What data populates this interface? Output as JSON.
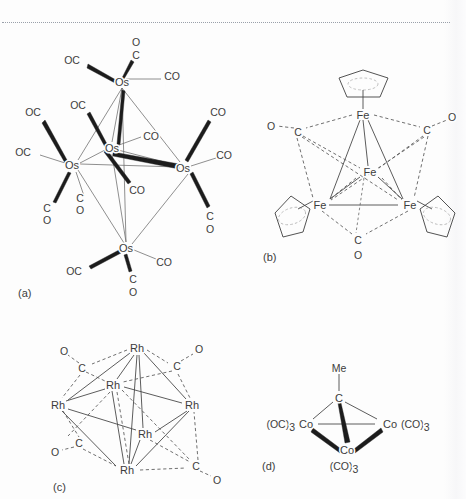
{
  "page": {
    "background_color": "#fdfdfd",
    "ink_color": "#3c3c3c",
    "bond_color": "#4a4a4a",
    "wedge_color": "#1c1c1c",
    "rule": {
      "style": "dotted",
      "color": "#9aa0aa"
    }
  },
  "figure": {
    "type": "chemical-structure-diagram",
    "panels": [
      {
        "key": "a",
        "label": "(a)",
        "compound": "Os6(CO)18 trigonal-bipyramidal osmium carbonyl cluster",
        "metal": "Os",
        "metal_count": 5,
        "geometry": "trigonal bipyramid",
        "atoms": [
          {
            "id": "os-apex-top",
            "label": "Os",
            "x": 122,
            "y": 82
          },
          {
            "id": "os-equat-left",
            "label": "Os",
            "x": 72,
            "y": 165
          },
          {
            "id": "os-equat-mid",
            "label": "Os",
            "x": 112,
            "y": 148
          },
          {
            "id": "os-equat-right",
            "label": "Os",
            "x": 183,
            "y": 168
          },
          {
            "id": "os-apex-bottom",
            "label": "Os",
            "x": 126,
            "y": 248
          }
        ],
        "ligands": [
          {
            "id": "a-lig-1",
            "label": "O",
            "x": 136,
            "y": 42
          },
          {
            "id": "a-lig-2",
            "label": "C",
            "x": 136,
            "y": 55
          },
          {
            "id": "a-lig-3",
            "label": "OC",
            "x": 72,
            "y": 60
          },
          {
            "id": "a-lig-4",
            "label": "CO",
            "x": 166,
            "y": 76
          },
          {
            "id": "a-lig-5",
            "label": "OC",
            "x": 78,
            "y": 105
          },
          {
            "id": "a-lig-6",
            "label": "CO",
            "x": 145,
            "y": 136
          },
          {
            "id": "a-lig-7",
            "label": "OC",
            "x": 33,
            "y": 112
          },
          {
            "id": "a-lig-8",
            "label": "OC",
            "x": 23,
            "y": 152
          },
          {
            "id": "a-lig-9",
            "label": "C",
            "x": 47,
            "y": 208
          },
          {
            "id": "a-lig-10",
            "label": "O",
            "x": 47,
            "y": 220
          },
          {
            "id": "a-lig-11",
            "label": "C",
            "x": 80,
            "y": 198
          },
          {
            "id": "a-lig-12",
            "label": "O",
            "x": 80,
            "y": 210
          },
          {
            "id": "a-lig-13",
            "label": "CO",
            "x": 131,
            "y": 190
          },
          {
            "id": "a-lig-14",
            "label": "CO",
            "x": 216,
            "y": 112
          },
          {
            "id": "a-lig-15",
            "label": "CO",
            "x": 222,
            "y": 155
          },
          {
            "id": "a-lig-16",
            "label": "C",
            "x": 210,
            "y": 216
          },
          {
            "id": "a-lig-17",
            "label": "O",
            "x": 210,
            "y": 229
          },
          {
            "id": "a-lig-18",
            "label": "OC",
            "x": 74,
            "y": 271
          },
          {
            "id": "a-lig-19",
            "label": "CO",
            "x": 161,
            "y": 262
          },
          {
            "id": "a-lig-20",
            "label": "C",
            "x": 133,
            "y": 279
          },
          {
            "id": "a-lig-21",
            "label": "O",
            "x": 133,
            "y": 292
          }
        ]
      },
      {
        "key": "b",
        "label": "(b)",
        "compound": "Cp4Fe4(CO)4 tetrahedral iron cluster with cyclopentadienyl ligands and triply-bridging carbonyls",
        "metal": "Fe",
        "metal_count": 4,
        "geometry": "tetrahedron",
        "atoms": [
          {
            "id": "fe-top",
            "label": "Fe",
            "x": 363,
            "y": 115
          },
          {
            "id": "fe-center",
            "label": "Fe",
            "x": 370,
            "y": 172
          },
          {
            "id": "fe-left",
            "label": "Fe",
            "x": 320,
            "y": 205
          },
          {
            "id": "fe-right",
            "label": "Fe",
            "x": 410,
            "y": 205
          }
        ],
        "ligands": [
          {
            "id": "b-lig-1",
            "label": "O",
            "x": 271,
            "y": 126
          },
          {
            "id": "b-lig-2",
            "label": "C",
            "x": 298,
            "y": 132
          },
          {
            "id": "b-lig-3",
            "label": "O",
            "x": 452,
            "y": 117
          },
          {
            "id": "b-lig-4",
            "label": "C",
            "x": 427,
            "y": 130
          },
          {
            "id": "b-lig-5",
            "label": "C",
            "x": 358,
            "y": 240
          },
          {
            "id": "b-lig-6",
            "label": "O",
            "x": 358,
            "y": 255
          }
        ],
        "cyclopentadienyl_rings": 4
      },
      {
        "key": "c",
        "label": "(c)",
        "compound": "Rh6(CO)16 octahedral rhodium carbonyl cluster with face-bridging carbonyls",
        "metal": "Rh",
        "metal_count": 6,
        "geometry": "octahedron",
        "atoms": [
          {
            "id": "rh-top",
            "label": "Rh",
            "x": 137,
            "y": 348
          },
          {
            "id": "rh-inner",
            "label": "Rh",
            "x": 113,
            "y": 385
          },
          {
            "id": "rh-left",
            "label": "Rh",
            "x": 58,
            "y": 405
          },
          {
            "id": "rh-right",
            "label": "Rh",
            "x": 192,
            "y": 405
          },
          {
            "id": "rh-mid",
            "label": "Rh",
            "x": 145,
            "y": 434
          },
          {
            "id": "rh-bottom",
            "label": "Rh",
            "x": 127,
            "y": 470
          }
        ],
        "ligands": [
          {
            "id": "c-lig-1",
            "label": "O",
            "x": 64,
            "y": 351
          },
          {
            "id": "c-lig-2",
            "label": "C",
            "x": 82,
            "y": 368
          },
          {
            "id": "c-lig-3",
            "label": "O",
            "x": 199,
            "y": 349
          },
          {
            "id": "c-lig-4",
            "label": "C",
            "x": 177,
            "y": 366
          },
          {
            "id": "c-lig-5",
            "label": "C",
            "x": 79,
            "y": 443
          },
          {
            "id": "c-lig-6",
            "label": "O",
            "x": 55,
            "y": 452
          },
          {
            "id": "c-lig-7",
            "label": "C",
            "x": 196,
            "y": 466
          },
          {
            "id": "c-lig-8",
            "label": "O",
            "x": 217,
            "y": 480
          }
        ]
      },
      {
        "key": "d",
        "label": "(d)",
        "compound": "MeCCo3(CO)9 methylidyne-capped tricobalt nonacarbonyl cluster",
        "metal": "Co",
        "metal_count": 3,
        "geometry": "tetrahedral C-Co3 core",
        "atoms": [
          {
            "id": "c-apex",
            "label": "C",
            "x": 339,
            "y": 398
          },
          {
            "id": "co-left",
            "label": "Co",
            "x": 306,
            "y": 424
          },
          {
            "id": "co-right",
            "label": "Co",
            "x": 390,
            "y": 424
          },
          {
            "id": "co-front",
            "label": "Co",
            "x": 347,
            "y": 450
          }
        ],
        "ligands": [
          {
            "id": "d-lig-me",
            "label": "Me",
            "x": 339,
            "y": 368
          },
          {
            "id": "d-lig-left",
            "label": "(OC)",
            "sub": "3",
            "x": 262,
            "y": 424
          },
          {
            "id": "d-lig-right",
            "label": "(CO)",
            "sub": "3",
            "x": 404,
            "y": 424
          },
          {
            "id": "d-lig-front",
            "label": "(CO)",
            "sub": "3",
            "x": 330,
            "y": 466
          }
        ]
      }
    ],
    "panel_labels": [
      {
        "key": "a",
        "text": "(a)",
        "x": 18,
        "y": 293
      },
      {
        "key": "b",
        "text": "(b)",
        "x": 263,
        "y": 257
      },
      {
        "key": "c",
        "text": "(c)",
        "x": 53,
        "y": 487
      },
      {
        "key": "d",
        "text": "(d)",
        "x": 262,
        "y": 466
      }
    ]
  }
}
